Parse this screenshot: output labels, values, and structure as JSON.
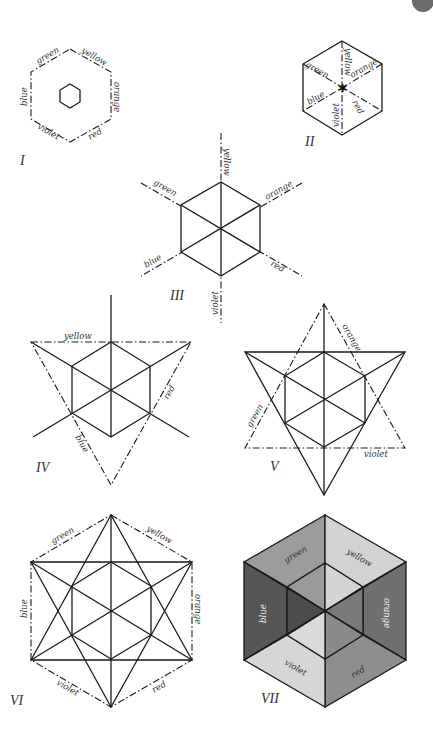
{
  "page": {
    "badge_color": "#6a6a6a"
  },
  "figures": [
    {
      "id": "I",
      "numeral": "I",
      "labels": {
        "green": "green",
        "yellow": "yellow",
        "orange": "orange",
        "red": "red",
        "violet": "violet",
        "blue": "blue"
      }
    },
    {
      "id": "II",
      "numeral": "II",
      "labels": {
        "green": "green",
        "yellow": "yellow",
        "orange": "orange",
        "red": "red",
        "violet": "violet",
        "blue": "blue"
      }
    },
    {
      "id": "III",
      "numeral": "III",
      "labels": {
        "green": "green",
        "yellow": "yellow",
        "orange": "orange",
        "red": "red",
        "violet": "violet",
        "blue": "blue"
      }
    },
    {
      "id": "IV",
      "numeral": "IV",
      "labels": {
        "yellow": "yellow",
        "red": "red",
        "blue": "blue"
      }
    },
    {
      "id": "V",
      "numeral": "V",
      "labels": {
        "orange": "orange",
        "green": "green",
        "violet": "violet"
      }
    },
    {
      "id": "VI",
      "numeral": "VI",
      "labels": {
        "green": "green",
        "yellow": "yellow",
        "orange": "orange",
        "red": "red",
        "violet": "violet",
        "blue": "blue"
      }
    },
    {
      "id": "VII",
      "numeral": "VII",
      "labels": {
        "green": "green",
        "yellow": "yellow",
        "orange": "orange",
        "red": "red",
        "violet": "violet",
        "blue": "blue"
      },
      "shades": {
        "green_outer": "#9c9c9c",
        "yellow_outer": "#d2d2d2",
        "orange_outer": "#707070",
        "red_outer": "#8e8e8e",
        "violet_outer": "#d6d6d6",
        "blue_outer": "#565656",
        "green_inner": "#9a9a9a",
        "yellow_inner": "#d4d4d4",
        "orange_inner": "#7a7a7a",
        "red_inner": "#8a8a8a",
        "violet_inner": "#dadada",
        "blue_inner": "#4c4c4c"
      }
    }
  ]
}
